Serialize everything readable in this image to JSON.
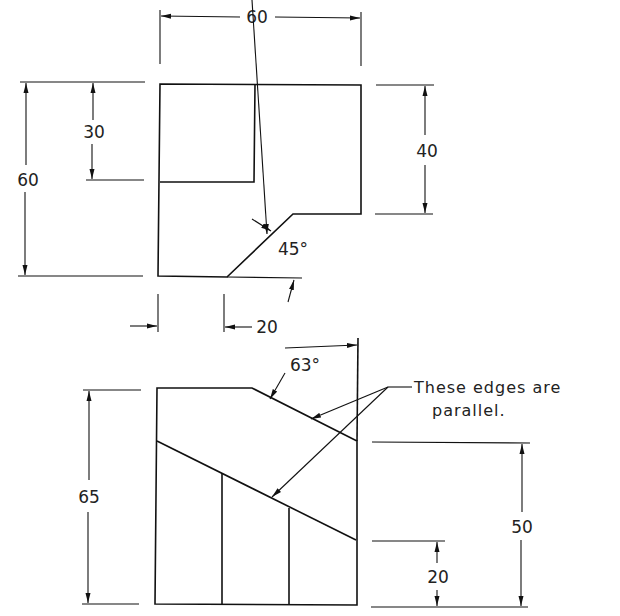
{
  "drawing": {
    "top_view": {
      "dimensions": {
        "width_top": "60",
        "height_left_total": "60",
        "height_left_inner": "30",
        "height_right": "40",
        "chamfer_angle": "45°",
        "offset_bottom": "20"
      }
    },
    "front_view": {
      "dimensions": {
        "height_left": "65",
        "angle": "63°",
        "height_right_total": "50",
        "height_right_lower": "20"
      },
      "note_line1": "These edges are",
      "note_line2": "parallel."
    },
    "colors": {
      "line": "#111111",
      "background": "#ffffff"
    }
  }
}
